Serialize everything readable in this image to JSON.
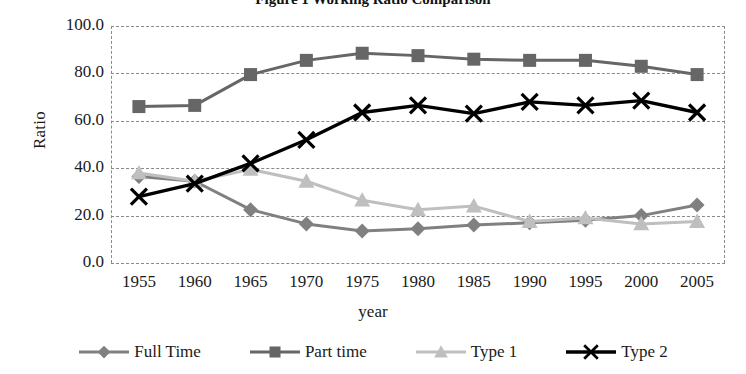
{
  "figure": {
    "title": "Figure 1  Working Ratio Comparison",
    "title_clipped": true
  },
  "chart_data": {
    "type": "line",
    "title": "Figure 1  Working Ratio Comparison",
    "xlabel": "year",
    "ylabel": "Ratio",
    "ylim": [
      0.0,
      100.0
    ],
    "ytick_step": 20.0,
    "ytick_labels": [
      "100.0",
      "80.0",
      "60.0",
      "40.0",
      "20.0",
      "0.0"
    ],
    "ytick_values": [
      100.0,
      80.0,
      60.0,
      40.0,
      20.0,
      0.0
    ],
    "grid": "horizontal-dashed",
    "legend_position": "bottom",
    "categories": [
      "1955",
      "1960",
      "1965",
      "1970",
      "1975",
      "1980",
      "1985",
      "1990",
      "1995",
      "2000",
      "2005"
    ],
    "x": [
      1955,
      1960,
      1965,
      1970,
      1975,
      1980,
      1985,
      1990,
      1995,
      2000,
      2005
    ],
    "series": [
      {
        "name": "Full Time",
        "marker": "diamond",
        "color": "#808080",
        "values": [
          36.5,
          34.5,
          22.5,
          16.5,
          13.5,
          14.5,
          16.0,
          17.0,
          18.0,
          20.0,
          24.5
        ]
      },
      {
        "name": "Part time",
        "marker": "square",
        "color": "#666666",
        "values": [
          66.0,
          66.5,
          79.5,
          85.5,
          88.5,
          87.5,
          86.0,
          85.5,
          85.5,
          83.0,
          79.5
        ]
      },
      {
        "name": "Type 1",
        "marker": "triangle",
        "color": "#bfbfbf",
        "values": [
          38.0,
          34.5,
          39.5,
          34.5,
          26.5,
          22.5,
          24.0,
          17.5,
          19.0,
          16.5,
          17.5
        ]
      },
      {
        "name": "Type 2",
        "marker": "x",
        "color": "#000000",
        "values": [
          28.0,
          33.5,
          42.0,
          52.0,
          63.5,
          66.5,
          63.0,
          68.0,
          66.5,
          68.5,
          63.5
        ]
      }
    ]
  },
  "legend": {
    "items": [
      {
        "label": "Full Time",
        "marker": "diamond",
        "color": "#808080"
      },
      {
        "label": "Part time",
        "marker": "square",
        "color": "#666666"
      },
      {
        "label": "Type 1",
        "marker": "triangle",
        "color": "#bfbfbf"
      },
      {
        "label": "Type 2",
        "marker": "x",
        "color": "#000000"
      }
    ]
  }
}
